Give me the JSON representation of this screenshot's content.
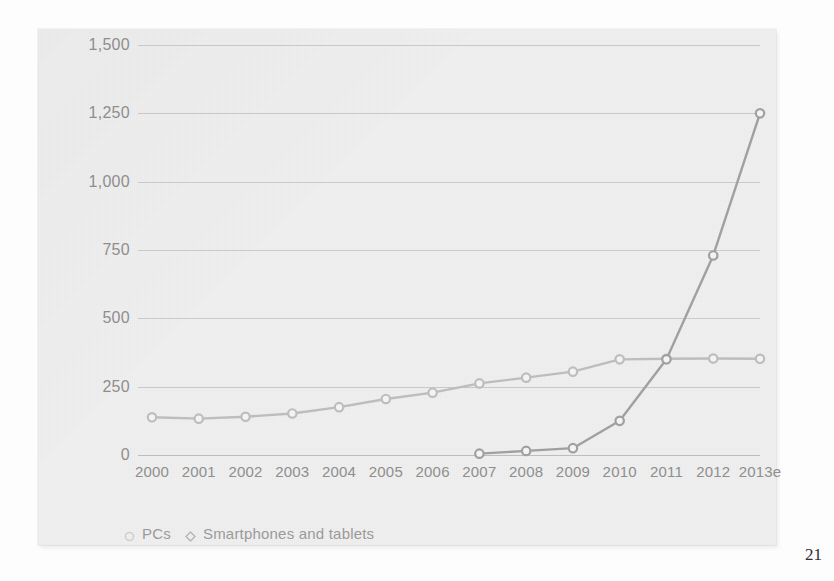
{
  "page": {
    "page_number": "21"
  },
  "chart_data": {
    "type": "line",
    "title": "",
    "subtitle": "",
    "xlabel": "",
    "ylabel": "",
    "categories": [
      "2000",
      "2001",
      "2002",
      "2003",
      "2004",
      "2005",
      "2006",
      "2007",
      "2008",
      "2009",
      "2010",
      "2011",
      "2012",
      "2013e"
    ],
    "ylim": [
      0,
      1500
    ],
    "yticks": [
      "0",
      "250",
      "500",
      "750",
      "1,000",
      "1,250",
      "1,500"
    ],
    "ytick_values": [
      0,
      250,
      500,
      750,
      1000,
      1250,
      1500
    ],
    "grid": true,
    "legend_position": "bottom-left",
    "series": [
      {
        "name": "PCs",
        "color": "#bdbdbd",
        "marker": "circle",
        "values": [
          138,
          133,
          140,
          152,
          175,
          205,
          228,
          262,
          283,
          305,
          350,
          352,
          353,
          352
        ]
      },
      {
        "name": "Smartphones and tablets",
        "color": "#a0a0a0",
        "marker": "circle",
        "values": [
          null,
          null,
          null,
          null,
          null,
          null,
          null,
          5,
          15,
          25,
          125,
          350,
          730,
          1250
        ]
      }
    ]
  },
  "legend": {
    "items": [
      {
        "label": "PCs",
        "marker": "circle-marker"
      },
      {
        "label": "Smartphones and tablets",
        "marker": "diamond-marker"
      }
    ]
  },
  "colors": {
    "panel_background": "#f0f0f0",
    "grid": "#c9c9c9",
    "axis_text": "#8e8e8e",
    "pc_series": "#bdbdbd",
    "smartphone_series": "#a0a0a0"
  }
}
